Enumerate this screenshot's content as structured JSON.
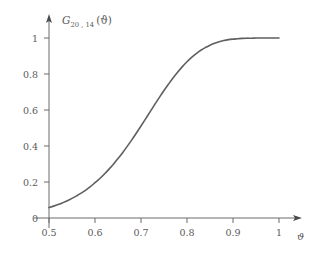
{
  "chart_data": {
    "type": "line",
    "title_parts": {
      "symbol": "G",
      "subscript": "20 , 14",
      "argument": "(ϑ)"
    },
    "xlabel": "ϑ",
    "ylabel": "",
    "xlim": [
      0.5,
      1.0
    ],
    "ylim": [
      0,
      1.0
    ],
    "grid": false,
    "legend": null,
    "x_ticks": [
      "0.5",
      "0.6",
      "0.7",
      "0.8",
      "0.9",
      "1"
    ],
    "x_tick_values": [
      0.5,
      0.6,
      0.7,
      0.8,
      0.9,
      1.0
    ],
    "y_ticks": [
      "0",
      "0.2",
      "0.4",
      "0.6",
      "0.8",
      "1"
    ],
    "y_tick_values": [
      0,
      0.2,
      0.4,
      0.6,
      0.8,
      1.0
    ],
    "series": [
      {
        "name": "G_{20,14}(ϑ)",
        "color": "#5f5f5f",
        "line_width": 1.6,
        "x": [
          0.5,
          0.51,
          0.52,
          0.53,
          0.54,
          0.55,
          0.56,
          0.57,
          0.58,
          0.59,
          0.6,
          0.61,
          0.62,
          0.63,
          0.64,
          0.65,
          0.66,
          0.67,
          0.68,
          0.69,
          0.7,
          0.71,
          0.72,
          0.73,
          0.74,
          0.75,
          0.76,
          0.77,
          0.78,
          0.79,
          0.8,
          0.81,
          0.82,
          0.83,
          0.84,
          0.85,
          0.86,
          0.87,
          0.88,
          0.89,
          0.9,
          0.91,
          0.92,
          0.93,
          0.94,
          0.95,
          0.96,
          0.97,
          0.98,
          0.99,
          1.0
        ],
        "y": [
          0.058,
          0.066,
          0.075,
          0.085,
          0.096,
          0.109,
          0.123,
          0.138,
          0.155,
          0.174,
          0.196,
          0.218,
          0.243,
          0.27,
          0.299,
          0.33,
          0.363,
          0.398,
          0.434,
          0.472,
          0.511,
          0.551,
          0.591,
          0.631,
          0.67,
          0.708,
          0.744,
          0.779,
          0.811,
          0.841,
          0.868,
          0.892,
          0.913,
          0.932,
          0.947,
          0.96,
          0.971,
          0.979,
          0.986,
          0.991,
          0.994,
          0.996,
          0.998,
          0.999,
          0.999,
          1.0,
          1.0,
          1.0,
          1.0,
          1.0,
          1.0
        ]
      }
    ],
    "annotations": [],
    "axis_style": {
      "color": "#6b6b6b",
      "x_axis_arrow": true,
      "y_axis_arrow": true,
      "tick_direction": "out"
    },
    "background": "#ffffff"
  }
}
